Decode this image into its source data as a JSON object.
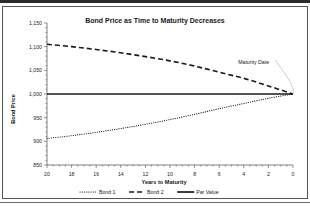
{
  "chart_data": {
    "type": "line",
    "title": "Bond Price as Time to Maturity Decreases",
    "xlabel": "Years to Maturity",
    "ylabel": "Bond Price",
    "xlim": [
      20,
      0
    ],
    "ylim": [
      850,
      1150
    ],
    "x_reversed": true,
    "grid": false,
    "legend_position": "bottom",
    "xticks": [
      "20",
      "18",
      "16",
      "14",
      "12",
      "10",
      "8",
      "6",
      "4",
      "2",
      "0"
    ],
    "xtick_values": [
      20,
      18,
      16,
      14,
      12,
      10,
      8,
      6,
      4,
      2,
      0
    ],
    "yticks": [
      "850",
      "900",
      "950",
      "1,000",
      "1,050",
      "1,100",
      "1,150"
    ],
    "ytick_values": [
      850,
      900,
      950,
      1000,
      1050,
      1100,
      1150
    ],
    "x": [
      20,
      18,
      16,
      14,
      12,
      10,
      8,
      6,
      4,
      2,
      0
    ],
    "series": [
      {
        "name": "Bond 1",
        "style": "dotted",
        "color": "#1a1a1a",
        "values": [
          906,
          912,
          919,
          927,
          936,
          946,
          957,
          969,
          980,
          991,
          1000
        ]
      },
      {
        "name": "Bond 2",
        "style": "dashed",
        "color": "#1a1a1a",
        "values": [
          1105,
          1100,
          1094,
          1087,
          1079,
          1070,
          1059,
          1046,
          1033,
          1017,
          1000
        ]
      },
      {
        "name": "Par Value",
        "style": "solid",
        "color": "#1a1a1a",
        "values": [
          1000,
          1000,
          1000,
          1000,
          1000,
          1000,
          1000,
          1000,
          1000,
          1000,
          1000
        ]
      }
    ],
    "annotations": [
      {
        "text": "Maturity Date",
        "x": 3.2,
        "y": 1063,
        "points_to_x": 0,
        "points_to_y": 1000
      }
    ]
  },
  "legend": {
    "items": [
      {
        "label": "Bond 1",
        "style": "dotted"
      },
      {
        "label": "Bond 2",
        "style": "dashed"
      },
      {
        "label": "Par Value",
        "style": "solid"
      }
    ]
  },
  "colors": {
    "ink": "#1a1a1a",
    "axis": "#4a4a4a",
    "frame": "#555555",
    "top_bar": "#2b2b2b",
    "leader": "#b8b8b8",
    "background": "#ffffff"
  }
}
